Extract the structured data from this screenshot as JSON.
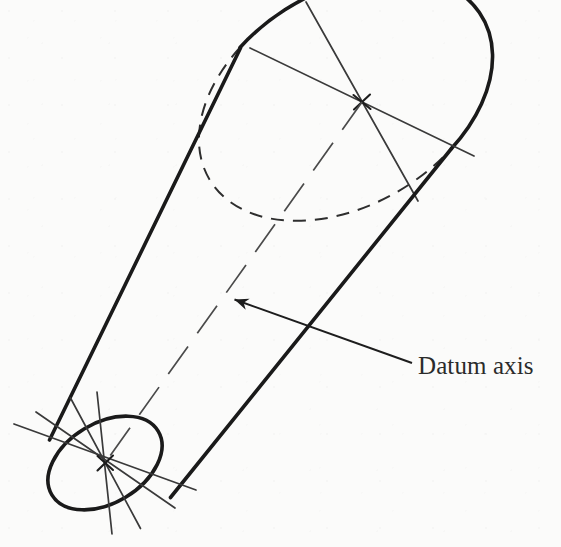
{
  "figure": {
    "kind": "engineering-drawing",
    "background_color": "#fbfbfa",
    "ink_color": "#1d1d1d",
    "thin_ink_color": "#3a3a3a"
  },
  "annotations": {
    "datum_axis_label": "Datum axis"
  },
  "geometry": {
    "top_face": {
      "name": "top-ellipse",
      "center": [
        362,
        102
      ],
      "radius_x": 92,
      "radius_y": 62,
      "rotation_deg": -31,
      "visible_arc": "upper-right solid",
      "hidden_arc": "lower-left dashed"
    },
    "bottom_face": {
      "name": "bottom-ellipse",
      "center": [
        105,
        463
      ],
      "radius_x": 62,
      "radius_y": 40,
      "rotation_deg": -31,
      "visible_arc": "full solid"
    },
    "silhouette_lines": [
      {
        "name": "left-edge",
        "from": [
          240,
          48
        ],
        "to": [
          50,
          440
        ]
      },
      {
        "name": "right-edge",
        "from": [
          452,
          148
        ],
        "to": [
          170,
          497
        ]
      }
    ],
    "datum_axis_line": {
      "name": "datum-axis-centerline",
      "from": [
        362,
        102
      ],
      "to": [
        105,
        463
      ],
      "style": "long-dash"
    },
    "leader": {
      "name": "datum-axis-leader",
      "tail": [
        412,
        363
      ],
      "head": [
        232,
        298
      ],
      "arrowhead": "filled-triangle"
    }
  }
}
